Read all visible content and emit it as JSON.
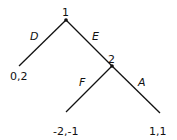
{
  "diagram": {
    "type": "game-tree",
    "nodes": [
      {
        "id": "1",
        "label": "1",
        "x": 66,
        "y": 19
      },
      {
        "id": "2",
        "label": "2",
        "x": 112,
        "y": 65
      }
    ],
    "edges": [
      {
        "from": "1",
        "action": "D",
        "to": "leaf_D"
      },
      {
        "from": "1",
        "action": "E",
        "to": "2"
      },
      {
        "from": "2",
        "action": "F",
        "to": "leaf_F"
      },
      {
        "from": "2",
        "action": "A",
        "to": "leaf_A"
      }
    ],
    "leaves": [
      {
        "id": "leaf_D",
        "payoff": "0,2"
      },
      {
        "id": "leaf_F",
        "payoff": "-2,-1"
      },
      {
        "id": "leaf_A",
        "payoff": "1,1"
      }
    ]
  },
  "labels": {
    "node1": "1",
    "node2": "2",
    "actionD": "D",
    "actionE": "E",
    "actionF": "F",
    "actionA": "A",
    "payoffD": "0,2",
    "payoffF": "-2,-1",
    "payoffA": "1,1"
  }
}
